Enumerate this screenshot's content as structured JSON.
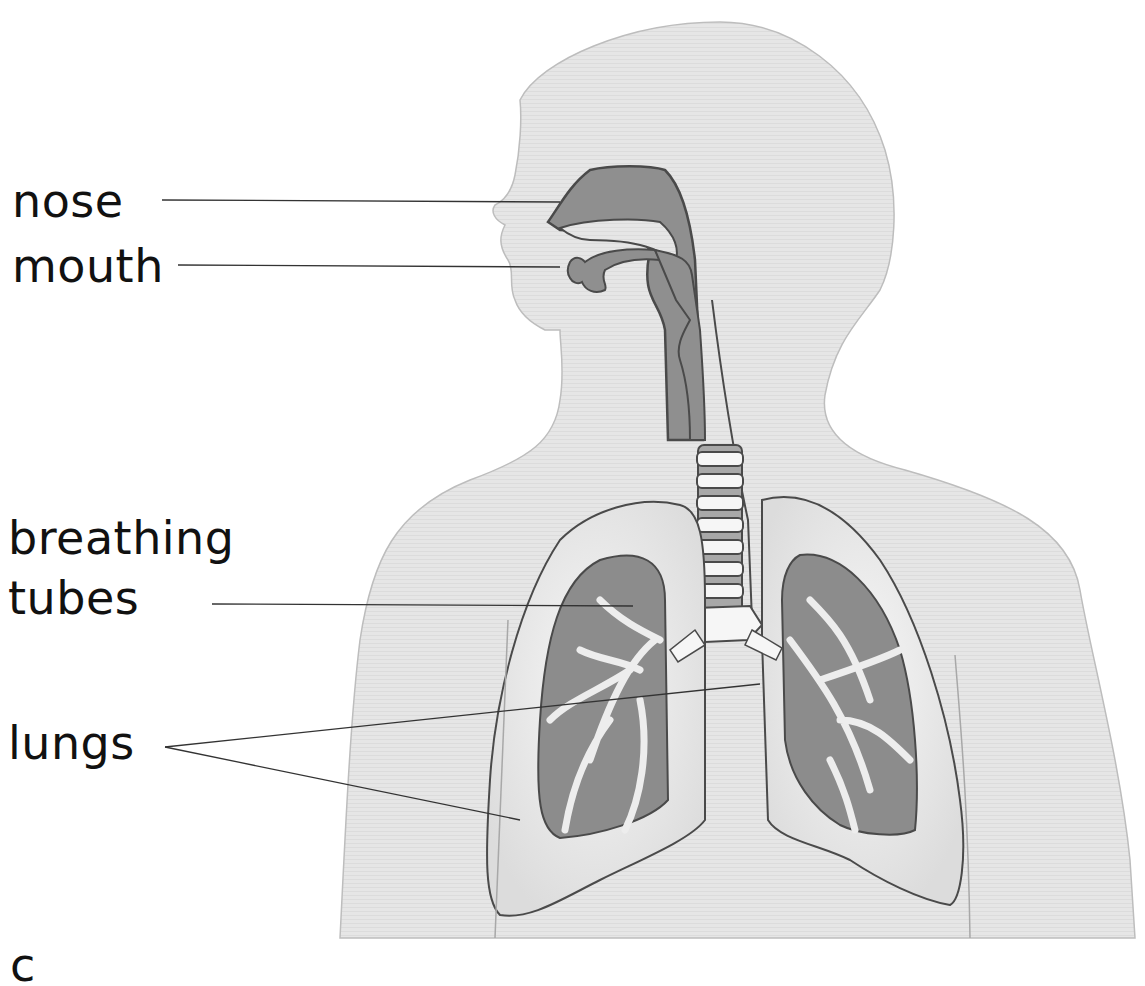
{
  "diagram": {
    "colors": {
      "body_fill": "#e4e4e4",
      "body_outline": "#bdbdbd",
      "airway_fill": "#8f8f8f",
      "airway_outline": "#4a4a4a",
      "lung_fill": "#efefef",
      "lung_inner": "#8c8c8c",
      "cartilage": "#f6f6f6",
      "leader_line": "#333333",
      "label_text": "#111111"
    },
    "labels": [
      {
        "id": "nose",
        "lines": [
          "nose"
        ],
        "x": 12,
        "y": 178
      },
      {
        "id": "mouth",
        "lines": [
          "mouth"
        ],
        "x": 12,
        "y": 243
      },
      {
        "id": "breathing-tubes",
        "lines": [
          "breathing",
          "tubes"
        ],
        "x": 8,
        "y": 515
      },
      {
        "id": "lungs",
        "lines": [
          "lungs"
        ],
        "x": 8,
        "y": 720
      }
    ],
    "leader_lines": [
      {
        "label": "nose",
        "x1": 162,
        "y1": 200,
        "x2": 560,
        "y2": 202
      },
      {
        "label": "mouth",
        "x1": 178,
        "y1": 265,
        "x2": 560,
        "y2": 267
      },
      {
        "label": "breathing-tubes",
        "x1": 212,
        "y1": 604,
        "x2": 633,
        "y2": 606
      },
      {
        "label": "lungs",
        "x1": 165,
        "y1": 747,
        "x2": 760,
        "y2": 684
      },
      {
        "label": "lungs",
        "x1": 165,
        "y1": 747,
        "x2": 520,
        "y2": 820
      }
    ],
    "page_fragment": "c"
  }
}
